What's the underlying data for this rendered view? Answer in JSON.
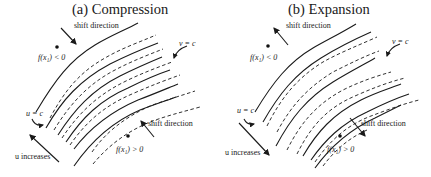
{
  "figure": {
    "panels": [
      {
        "id": "a",
        "title": "(a) Compression",
        "labels": {
          "shift_top": "shift direction",
          "shift_bottom": "shift direction",
          "f_neg": "f(x₁) < 0",
          "f_pos": "f(x₁) > 0",
          "v_eq_c": "v = c",
          "u_eq_c": "u = c",
          "u_increases": "u increases"
        },
        "shift_arrows": "pointing toward curves (inward)",
        "curves": "alternating solid (u-level) and dashed (v-level) curves, converging in the middle"
      },
      {
        "id": "b",
        "title": "(b) Expansion",
        "labels": {
          "shift_top": "shift direction",
          "shift_bottom": "shift direction",
          "f_neg": "f(x₁) < 0",
          "f_pos": "f(x₁) > 0",
          "v_eq_c": "v = c",
          "u_eq_c": "u = c",
          "u_increases": "u increases"
        },
        "shift_arrows": "pointing away from curves (outward)",
        "curves": "solid and dashed curve pairs overlapping at edges, separating in the middle"
      }
    ],
    "colors": {
      "ink": "#1a1a1a",
      "background": "#ffffff"
    }
  }
}
